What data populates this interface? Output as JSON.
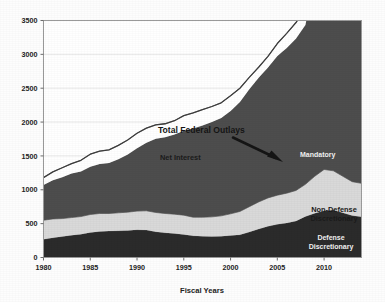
{
  "chart_data": {
    "type": "area",
    "title": "",
    "xlabel": "Fiscal Years",
    "ylabel": "",
    "xlim": [
      1980,
      2014
    ],
    "ylim": [
      0,
      3500
    ],
    "ytick_labels": [
      "0",
      "500",
      "1000",
      "1500",
      "2000",
      "2500",
      "3000",
      "3500"
    ],
    "yticks": [
      0,
      500,
      1000,
      1500,
      2000,
      2500,
      3000,
      3500
    ],
    "xtick_labels": [
      "1980",
      "1985",
      "1990",
      "1995",
      "2000",
      "2005",
      "2010"
    ],
    "xticks": [
      1980,
      1985,
      1990,
      1995,
      2000,
      2005,
      2010
    ],
    "grid": true,
    "legend_position": "inline-annotations",
    "stacked": true,
    "x": [
      1980,
      1981,
      1982,
      1983,
      1984,
      1985,
      1986,
      1987,
      1988,
      1989,
      1990,
      1991,
      1992,
      1993,
      1994,
      1995,
      1996,
      1997,
      1998,
      1999,
      2000,
      2001,
      2002,
      2003,
      2004,
      2005,
      2006,
      2007,
      2008,
      2009,
      2010,
      2011,
      2012,
      2013,
      2014
    ],
    "series": [
      {
        "name": "Defense Discretionary",
        "color": "#2b2b2b",
        "values": [
          270,
          290,
          310,
          330,
          345,
          370,
          385,
          390,
          395,
          400,
          410,
          405,
          380,
          365,
          355,
          340,
          320,
          315,
          310,
          315,
          325,
          335,
          375,
          420,
          460,
          490,
          510,
          540,
          605,
          655,
          690,
          700,
          660,
          620,
          600
        ]
      },
      {
        "name": "Non-Defense Discretionary",
        "color": "#d9d9d9",
        "values": [
          280,
          280,
          265,
          260,
          260,
          265,
          265,
          260,
          265,
          270,
          275,
          285,
          285,
          285,
          285,
          285,
          275,
          280,
          290,
          300,
          320,
          345,
          375,
          400,
          420,
          430,
          440,
          450,
          475,
          545,
          610,
          580,
          540,
          500,
          495
        ]
      },
      {
        "name": "Mandatory",
        "color": "#4d4d4d",
        "values": [
          520,
          570,
          610,
          650,
          665,
          705,
          730,
          745,
          790,
          850,
          930,
          1005,
          1090,
          1125,
          1175,
          1245,
          1310,
          1355,
          1400,
          1445,
          1520,
          1615,
          1735,
          1835,
          1925,
          2055,
          2145,
          2245,
          2355,
          2900,
          2635,
          2510,
          2450,
          2435,
          2510
        ]
      },
      {
        "name": "Net Interest",
        "color": "#ffffff",
        "values": [
          110,
          125,
          140,
          145,
          165,
          185,
          190,
          195,
          205,
          215,
          220,
          215,
          205,
          200,
          205,
          225,
          230,
          235,
          230,
          225,
          225,
          205,
          175,
          155,
          165,
          185,
          215,
          235,
          250,
          190,
          195,
          225,
          220,
          220,
          225
        ]
      }
    ],
    "total_line": {
      "name": "Total Federal Outlays",
      "color": "#3d3d3d",
      "values": [
        1180,
        1265,
        1325,
        1385,
        1435,
        1525,
        1570,
        1590,
        1655,
        1735,
        1835,
        1910,
        1960,
        1975,
        2020,
        2095,
        2135,
        2185,
        2230,
        2285,
        2390,
        2500,
        2660,
        2810,
        2970,
        3160,
        3310,
        3470,
        3685,
        4290,
        4130,
        4015,
        3870,
        3775,
        3830
      ]
    },
    "annotations": [
      {
        "id": "total-federal-outlays",
        "text": "Total Federal Outlays",
        "style": "dark-on-white"
      },
      {
        "id": "net-interest",
        "text": "Net Interest",
        "style": "dark-on-white"
      },
      {
        "id": "mandatory",
        "text": "Mandatory",
        "style": "light-on-dark"
      },
      {
        "id": "non-defense-discretionary-line1",
        "text": "Non-Defense",
        "style": "dark-on-light"
      },
      {
        "id": "non-defense-discretionary-line2",
        "text": "Discretionary",
        "style": "dark-on-light"
      },
      {
        "id": "defense-discretionary-line1",
        "text": "Defense",
        "style": "light-on-dark"
      },
      {
        "id": "defense-discretionary-line2",
        "text": "Discretionary",
        "style": "light-on-dark"
      }
    ]
  },
  "axis": {
    "x_title": "Fiscal Years",
    "y_ticks": [
      "3500",
      "3000",
      "2500",
      "2000",
      "1500",
      "1000",
      "500",
      "0"
    ],
    "x_ticks": [
      "1980",
      "1985",
      "1990",
      "1995",
      "2000",
      "2005",
      "2010"
    ]
  },
  "labels": {
    "total_federal_outlays": "Total Federal Outlays",
    "net_interest": "Net Interest",
    "mandatory": "Mandatory",
    "non_defense_l1": "Non-Defense",
    "non_defense_l2": "Discretionary",
    "defense_l1": "Defense",
    "defense_l2": "Discretionary"
  },
  "colors": {
    "defense": "#2b2b2b",
    "non_defense": "#d9d9d9",
    "mandatory": "#4d4d4d",
    "net_interest": "#ffffff",
    "total_line": "#3d3d3d",
    "frame": "#9a9a9a",
    "grid": "#e2e2e2",
    "background": "#fdfdfd"
  }
}
